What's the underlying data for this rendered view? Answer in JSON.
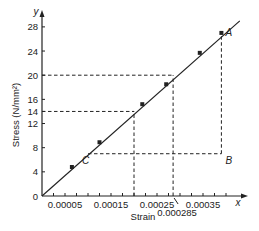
{
  "chart_data": {
    "type": "line",
    "title": "",
    "xlabel": "Strain",
    "ylabel": "Stress (N/mm²)",
    "x_axis_var": "x",
    "y_axis_var": "y",
    "xlim": [
      0,
      0.00042
    ],
    "ylim": [
      0,
      30
    ],
    "grid": false,
    "legend": null,
    "x_ticks": [
      2.5e-05,
      5e-05,
      7.5e-05,
      0.0001,
      0.000125,
      0.00015,
      0.000175,
      0.0002,
      0.000225,
      0.00025,
      0.000275,
      0.0003,
      0.000325,
      0.00035,
      0.000375,
      0.0004
    ],
    "x_tick_labels": [
      {
        "value": 5e-05,
        "label": "0.00005"
      },
      {
        "value": 0.00015,
        "label": "0.00015"
      },
      {
        "value": 0.00025,
        "label": "0.00025"
      },
      {
        "value": 0.00035,
        "label": "0.00035"
      }
    ],
    "y_tick_labels": [
      {
        "value": 0,
        "label": "0"
      },
      {
        "value": 4,
        "label": "4"
      },
      {
        "value": 8,
        "label": "8"
      },
      {
        "value": 12,
        "label": "12"
      },
      {
        "value": 14,
        "label": "14"
      },
      {
        "value": 16,
        "label": "16"
      },
      {
        "value": 20,
        "label": "20"
      },
      {
        "value": 24,
        "label": "24"
      },
      {
        "value": 28,
        "label": "28"
      }
    ],
    "series": [
      {
        "name": "Stress-strain line",
        "line": {
          "x": [
            0,
            0.00043
          ],
          "y": [
            0,
            29
          ]
        },
        "points": [
          {
            "x": 6.5e-05,
            "y": 4.8
          },
          {
            "x": 0.000125,
            "y": 8.9
          },
          {
            "x": 0.000218,
            "y": 15.2
          },
          {
            "x": 0.00027,
            "y": 18.5
          },
          {
            "x": 0.000343,
            "y": 23.7
          },
          {
            "x": 0.00039,
            "y": 27.0
          }
        ]
      }
    ],
    "annotations": [
      {
        "label": "A",
        "x": 0.00039,
        "y": 27.0
      },
      {
        "label": "B",
        "x": 0.00039,
        "y": 7.0
      },
      {
        "label": "C",
        "x": 0.0001,
        "y": 7.0
      },
      {
        "label": "0.000285",
        "x": 0.000285,
        "y": 0,
        "note": "strain at stress 20"
      }
    ],
    "guide_lines": [
      {
        "type": "horizontal",
        "y": 20,
        "x_from": 0,
        "x_to": 0.000285
      },
      {
        "type": "vertical",
        "x": 0.000285,
        "y_from": 0,
        "y_to": 20
      },
      {
        "type": "horizontal",
        "y": 14,
        "x_from": 0,
        "x_to": 0.0002
      },
      {
        "type": "vertical",
        "x": 0.0002,
        "y_from": 0,
        "y_to": 14
      },
      {
        "type": "horizontal",
        "y": 7,
        "x_from": 0.0001,
        "x_to": 0.00039
      },
      {
        "type": "vertical",
        "x": 0.00039,
        "y_from": 7,
        "y_to": 27
      }
    ]
  },
  "colors": {
    "line": "#222222",
    "axis": "#222222",
    "text": "#222222",
    "background": "#ffffff"
  }
}
